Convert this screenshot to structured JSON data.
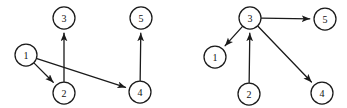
{
  "figure": {
    "background_color": "#ffffff",
    "stroke_color": "#1a1a1a",
    "label_color": "#111111",
    "node_radius": 11
  },
  "graphs": [
    {
      "id": "left-graph",
      "name": "left-directed-graph",
      "nodes": [
        {
          "id": "L1",
          "label": "1",
          "x": 26,
          "y": 55
        },
        {
          "id": "L2",
          "label": "2",
          "x": 64,
          "y": 93
        },
        {
          "id": "L3",
          "label": "3",
          "x": 64,
          "y": 18
        },
        {
          "id": "L4",
          "label": "4",
          "x": 140,
          "y": 92
        },
        {
          "id": "L5",
          "label": "5",
          "x": 141,
          "y": 18
        }
      ],
      "edges": [
        {
          "from": "L1",
          "to": "L2",
          "directed": true,
          "label": "1 to 2"
        },
        {
          "from": "L1",
          "to": "L4",
          "directed": true,
          "label": "1 to 4"
        },
        {
          "from": "L2",
          "to": "L3",
          "directed": true,
          "label": "2 to 3"
        },
        {
          "from": "L4",
          "to": "L5",
          "directed": true,
          "label": "4 to 5"
        }
      ]
    },
    {
      "id": "right-graph",
      "name": "right-directed-graph",
      "nodes": [
        {
          "id": "R1",
          "label": "1",
          "x": 215,
          "y": 57
        },
        {
          "id": "R2",
          "label": "2",
          "x": 249,
          "y": 94
        },
        {
          "id": "R3",
          "label": "3",
          "x": 250,
          "y": 18
        },
        {
          "id": "R4",
          "label": "4",
          "x": 322,
          "y": 93
        },
        {
          "id": "R5",
          "label": "5",
          "x": 325,
          "y": 19
        }
      ],
      "edges": [
        {
          "from": "R3",
          "to": "R1",
          "directed": true,
          "label": "3 to 1"
        },
        {
          "from": "R3",
          "to": "R5",
          "directed": true,
          "label": "3 to 5"
        },
        {
          "from": "R3",
          "to": "R4",
          "directed": true,
          "label": "3 to 4"
        },
        {
          "from": "R2",
          "to": "R3",
          "directed": true,
          "label": "2 to 3"
        }
      ]
    }
  ]
}
